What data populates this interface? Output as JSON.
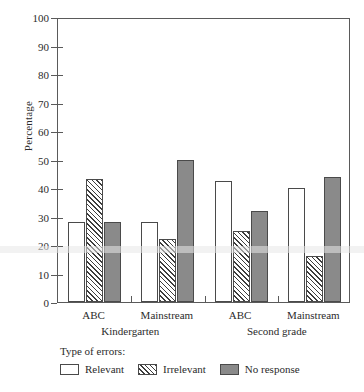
{
  "chart_data": {
    "type": "bar",
    "title": "",
    "xlabel": "",
    "ylabel": "Percentage",
    "ylim": [
      0,
      100
    ],
    "ytick_step": 10,
    "yticks": [
      0,
      10,
      20,
      30,
      40,
      50,
      60,
      70,
      80,
      90,
      100
    ],
    "grid": false,
    "legend_position": "below-axes",
    "legend_title": "Type of errors:",
    "categories": [
      "ABC",
      "Mainstream",
      "ABC",
      "Mainstream"
    ],
    "group_labels": [
      "Kindergarten",
      "Second grade"
    ],
    "series": [
      {
        "name": "Relevant",
        "values": [
          28,
          28,
          42.5,
          40
        ],
        "fill": "white",
        "color": "#ffffff"
      },
      {
        "name": "Irrelevant",
        "values": [
          43,
          22,
          25,
          16
        ],
        "fill": "hatch",
        "color": "#3d3d3d"
      },
      {
        "name": "No response",
        "values": [
          28,
          50,
          32,
          44
        ],
        "fill": "solid",
        "color": "#8a8a8a"
      }
    ]
  },
  "axis": {
    "ylabel": "Percentage",
    "ytick_labels": [
      "100",
      "90",
      "80",
      "70",
      "60",
      "50",
      "40",
      "30",
      "20",
      "10",
      "0"
    ],
    "xtick_labels": [
      "ABC",
      "Mainstream",
      "ABC",
      "Mainstream"
    ],
    "group_labels": [
      "Kindergarten",
      "Second grade"
    ]
  },
  "legend": {
    "title": "Type of errors:",
    "items": [
      {
        "label": "Relevant"
      },
      {
        "label": "Irrelevant"
      },
      {
        "label": "No response"
      }
    ]
  }
}
